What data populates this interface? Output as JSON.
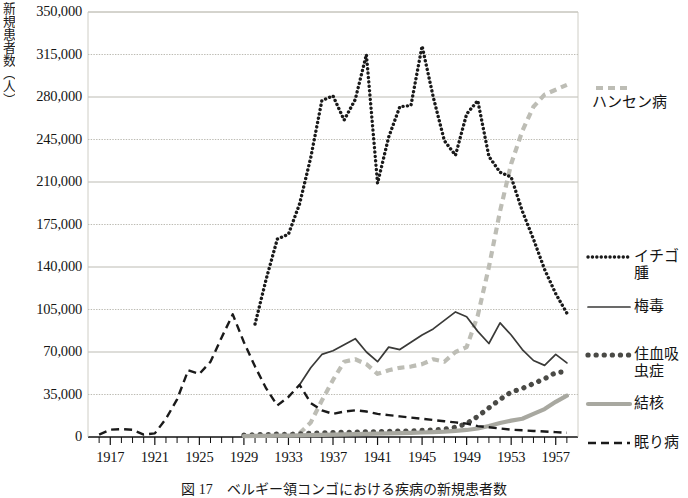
{
  "figure": {
    "caption": "図 17　ベルギー領コンゴにおける疾病の新規患者数",
    "y_axis_title": "新規患者数（人）"
  },
  "chart_data": {
    "type": "line",
    "title": "",
    "subtitle": "",
    "xlabel": "",
    "ylabel": "新規患者数（人）",
    "xlim": [
      1915,
      1959
    ],
    "ylim": [
      0,
      350000
    ],
    "grid": true,
    "legend_position": "right",
    "y_ticks": [
      0,
      35000,
      70000,
      105000,
      140000,
      175000,
      210000,
      245000,
      280000,
      315000,
      350000
    ],
    "y_tick_labels": [
      "0",
      "35,000",
      "70,000",
      "105,000",
      "140,000",
      "175,000",
      "210,000",
      "245,000",
      "280,000",
      "315,000",
      "350,000"
    ],
    "x_ticks": [
      1917,
      1921,
      1925,
      1929,
      1933,
      1937,
      1941,
      1945,
      1949,
      1953,
      1957
    ],
    "x_tick_labels": [
      "1917",
      "1921",
      "1925",
      "1929",
      "1933",
      "1937",
      "1941",
      "1945",
      "1949",
      "1953",
      "1957"
    ],
    "x_minor_tick_step": 1,
    "colors": {
      "hansen": "#bdbdb5",
      "yaws": "#1a1a1a",
      "syphilis": "#3a3a38",
      "schistosomiasis": "#4a4a46",
      "tuberculosis": "#a8a8a0",
      "sleeping_sickness": "#1a1a1a"
    },
    "series": [
      {
        "name": "ハンセン病",
        "key": "hansen",
        "style": "dashed-thick-gray",
        "x": [
          1934,
          1935,
          1936,
          1937,
          1938,
          1939,
          1940,
          1941,
          1942,
          1943,
          1944,
          1945,
          1946,
          1947,
          1948,
          1949,
          1950,
          1951,
          1952,
          1953,
          1954,
          1955,
          1956,
          1957,
          1958
        ],
        "values": [
          3000,
          12000,
          30000,
          47000,
          62000,
          64000,
          60000,
          52000,
          55000,
          57000,
          58000,
          60000,
          64000,
          62000,
          70000,
          74000,
          100000,
          140000,
          186000,
          225000,
          252000,
          272000,
          282000,
          286000,
          290000
        ]
      },
      {
        "name": "イチゴ腫",
        "key": "yaws",
        "style": "dotted-black",
        "x": [
          1930,
          1931,
          1932,
          1933,
          1934,
          1935,
          1936,
          1937,
          1938,
          1939,
          1940,
          1941,
          1942,
          1943,
          1944,
          1945,
          1946,
          1947,
          1948,
          1949,
          1950,
          1951,
          1952,
          1953,
          1954,
          1955,
          1956,
          1957,
          1958
        ],
        "values": [
          93000,
          130000,
          163000,
          167000,
          192000,
          230000,
          277000,
          281000,
          261000,
          278000,
          315000,
          209000,
          247000,
          272000,
          273000,
          322000,
          280000,
          244000,
          232000,
          266000,
          277000,
          231000,
          218000,
          214000,
          186000,
          163000,
          138000,
          118000,
          102000
        ]
      },
      {
        "name": "梅毒",
        "key": "syphilis",
        "style": "solid-thin-black",
        "x": [
          1934,
          1935,
          1936,
          1937,
          1938,
          1939,
          1940,
          1941,
          1942,
          1943,
          1944,
          1945,
          1946,
          1947,
          1948,
          1949,
          1950,
          1951,
          1952,
          1953,
          1954,
          1955,
          1956,
          1957,
          1958
        ],
        "values": [
          43000,
          57000,
          68000,
          71000,
          76000,
          81000,
          70000,
          62000,
          74000,
          72000,
          78000,
          84000,
          89000,
          96000,
          103000,
          99000,
          87000,
          77000,
          94000,
          84000,
          72000,
          63000,
          59000,
          68000,
          61000
        ]
      },
      {
        "name": "住血吸虫症",
        "key": "schistosomiasis",
        "style": "bigdot-darkgray",
        "x": [
          1929,
          1930,
          1931,
          1932,
          1933,
          1934,
          1935,
          1936,
          1937,
          1938,
          1939,
          1940,
          1941,
          1942,
          1943,
          1944,
          1945,
          1946,
          1947,
          1948,
          1949,
          1950,
          1951,
          1952,
          1953,
          1954,
          1955,
          1956,
          1957,
          1958
        ],
        "values": [
          1500,
          1800,
          2000,
          2400,
          2100,
          2600,
          3000,
          3400,
          3600,
          3800,
          4000,
          4200,
          4400,
          4600,
          4800,
          5000,
          5400,
          5800,
          6400,
          8000,
          11000,
          17000,
          24000,
          31000,
          37000,
          40000,
          44000,
          48000,
          53000,
          54000
        ]
      },
      {
        "name": "結核",
        "key": "tuberculosis",
        "style": "solid-thick-gray",
        "x": [
          1929,
          1930,
          1931,
          1932,
          1933,
          1934,
          1935,
          1936,
          1937,
          1938,
          1939,
          1940,
          1941,
          1942,
          1943,
          1944,
          1945,
          1946,
          1947,
          1948,
          1949,
          1950,
          1951,
          1952,
          1953,
          1954,
          1955,
          1956,
          1957,
          1958
        ],
        "values": [
          800,
          900,
          1000,
          1100,
          1200,
          1400,
          1600,
          1800,
          2000,
          2200,
          2400,
          2600,
          2800,
          3000,
          3200,
          3400,
          3700,
          4000,
          4400,
          5000,
          5800,
          7000,
          9000,
          11500,
          13500,
          15000,
          19000,
          23000,
          29000,
          34000
        ]
      },
      {
        "name": "眠り病",
        "key": "sleeping_sickness",
        "style": "dashed-black",
        "x": [
          1916,
          1917,
          1918,
          1919,
          1920,
          1921,
          1922,
          1923,
          1924,
          1925,
          1926,
          1927,
          1928,
          1929,
          1930,
          1931,
          1932,
          1933,
          1934,
          1935,
          1936,
          1937,
          1938,
          1939,
          1940,
          1941,
          1942,
          1943,
          1944,
          1945,
          1946,
          1947,
          1948,
          1949,
          1950,
          1951,
          1952,
          1953,
          1954,
          1955,
          1956,
          1957,
          1958
        ],
        "values": [
          2000,
          6000,
          6500,
          6000,
          2000,
          3000,
          15000,
          31000,
          55000,
          52000,
          62000,
          82000,
          101000,
          78000,
          58000,
          40000,
          26000,
          33000,
          43000,
          28000,
          22000,
          19000,
          21000,
          22000,
          21000,
          19000,
          18000,
          17000,
          16000,
          15000,
          14000,
          13000,
          12000,
          11000,
          9000,
          8000,
          7000,
          6000,
          5500,
          5000,
          4500,
          4000,
          3500
        ]
      }
    ],
    "legend": [
      {
        "label": "ハンセン病",
        "key": "hansen",
        "style": "dashed-thick-gray"
      },
      {
        "label": "イチゴ腫",
        "key": "yaws",
        "style": "dotted-black"
      },
      {
        "label": "梅毒",
        "key": "syphilis",
        "style": "solid-thin-black"
      },
      {
        "label": "住血吸\n虫症",
        "key": "schistosomiasis",
        "style": "bigdot-darkgray"
      },
      {
        "label": "結核",
        "key": "tuberculosis",
        "style": "solid-thick-gray"
      },
      {
        "label": "眠り病",
        "key": "sleeping_sickness",
        "style": "dashed-black"
      }
    ]
  }
}
